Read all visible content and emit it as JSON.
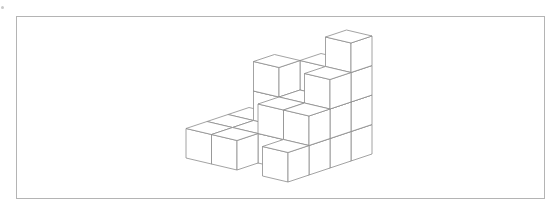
{
  "figure": {
    "frame_color": "#b4b4b4",
    "edge_color": "#8c8c8c",
    "face_color": "#ffffff",
    "projection": {
      "origin": [
        186,
        158
      ],
      "right": [
        25.5,
        6
      ],
      "back": [
        21,
        -7
      ],
      "up": [
        0,
        -29.5
      ]
    },
    "heightmap": [
      [
        1,
        1,
        1,
        0
      ],
      [
        1,
        1,
        3,
        0
      ],
      [
        0,
        2,
        2,
        3
      ],
      [
        1,
        2,
        3,
        4
      ]
    ]
  }
}
